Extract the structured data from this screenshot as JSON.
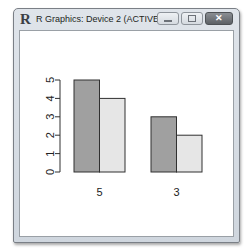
{
  "window": {
    "title": "R Graphics: Device 2 (ACTIVE)",
    "logo": "R",
    "buttons": {
      "minimize": "minimize-icon",
      "maximize": "maximize-icon",
      "close": "close-icon",
      "close_glyph": "✕"
    }
  },
  "colors": {
    "bar_dark": "#a0a0a0",
    "bar_light": "#e6e6e6",
    "bar_border": "#303030",
    "axis": "#303030"
  },
  "chart_data": {
    "type": "bar",
    "mode": "grouped",
    "categories": [
      "5",
      "3"
    ],
    "series": [
      {
        "name": "series-1",
        "color": "#a0a0a0",
        "values": [
          5,
          3
        ]
      },
      {
        "name": "series-2",
        "color": "#e6e6e6",
        "values": [
          4,
          2
        ]
      }
    ],
    "title": "",
    "xlabel": "",
    "ylabel": "",
    "ylim": [
      0,
      5
    ],
    "yticks": [
      "0",
      "1",
      "2",
      "3",
      "4",
      "5"
    ],
    "grid": false,
    "legend": null
  }
}
